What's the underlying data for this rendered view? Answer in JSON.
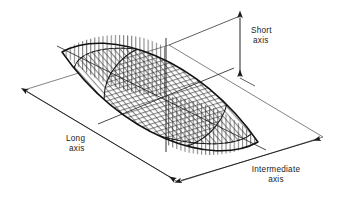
{
  "figure": {
    "background_color": "#ffffff",
    "line_color": "#1a1a1a",
    "hatch_color": "#2b2b2b",
    "hidden_line_color": "#1a1a1a",
    "reference_plane_color": "#555555"
  },
  "labels": {
    "short_axis": {
      "line1": "Short",
      "line2": "axis"
    },
    "long_axis": {
      "line1": "Long",
      "line2": "axis"
    },
    "intermediate_axis": {
      "line1": "Intermediate",
      "line2": "axis"
    }
  },
  "dimensions": [
    {
      "name": "short-axis-dimension",
      "orientation": "vertical",
      "arrowheads": "both",
      "x": 240,
      "y_top": 16,
      "y_bottom": 78
    },
    {
      "name": "long-axis-dimension",
      "orientation": "diagonal-down-right",
      "arrowheads": "both",
      "x1": 24,
      "y1": 90,
      "x2": 178,
      "y2": 182
    },
    {
      "name": "intermediate-axis-dimension",
      "orientation": "diagonal-up-right",
      "arrowheads": "both",
      "x1": 178,
      "y1": 182,
      "x2": 323,
      "y2": 137
    }
  ],
  "geometry": {
    "reference_plane_vertices": [
      {
        "x": 24,
        "y": 90
      },
      {
        "x": 178,
        "y": 182
      },
      {
        "x": 323,
        "y": 137
      },
      {
        "x": 169,
        "y": 45
      }
    ],
    "ellipsoid_center": {
      "x": 166,
      "y": 96
    },
    "sections": [
      {
        "name": "long-short-plane-section",
        "hatch": "vertical"
      },
      {
        "name": "long-intermediate-plane-section",
        "hatch": "horizontal"
      },
      {
        "name": "intermediate-short-plane-section",
        "hatch": "horizontal"
      }
    ],
    "hidden_edges": "dashed arc along lower rear of the horizontal ellipse"
  }
}
